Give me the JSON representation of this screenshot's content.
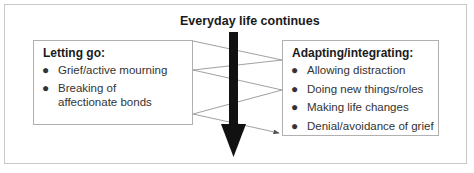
{
  "diagram": {
    "title": "Everyday life continues",
    "left_box": {
      "heading": "Letting go:",
      "items": [
        "Grief/active mourning",
        "Breaking of affectionate bonds"
      ]
    },
    "right_box": {
      "heading": "Adapting/integrating:",
      "items": [
        "Allowing distraction",
        "Doing new things/roles",
        "Making life changes",
        "Denial/avoidance of grief"
      ]
    },
    "bullet": "●",
    "colors": {
      "arrow": "#111111",
      "lines": "#888888",
      "border": "#b0b0b0"
    }
  }
}
